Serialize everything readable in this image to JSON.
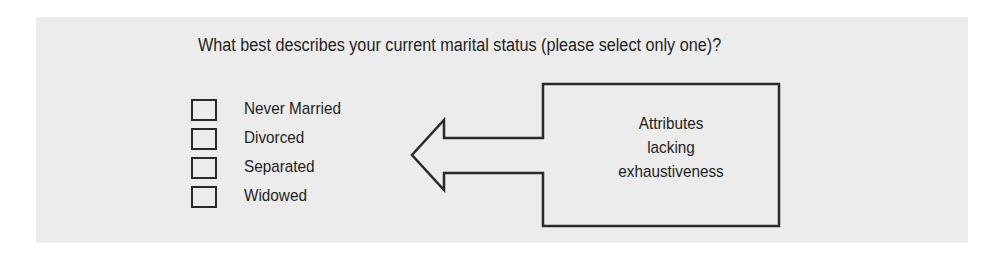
{
  "question": {
    "text": "What best describes your current marital status (please select only one)?"
  },
  "options": [
    {
      "label": "Never Married",
      "checked": false
    },
    {
      "label": "Divorced",
      "checked": false
    },
    {
      "label": "Separated",
      "checked": false
    },
    {
      "label": "Widowed",
      "checked": false
    }
  ],
  "callout": {
    "lines": [
      "Attributes",
      "lacking",
      "exhaustiveness"
    ],
    "direction": "points-left-to-options"
  },
  "colors": {
    "panel_background": "#ececec",
    "stroke": "#2a2a2a",
    "text": "#1e1e1e"
  }
}
